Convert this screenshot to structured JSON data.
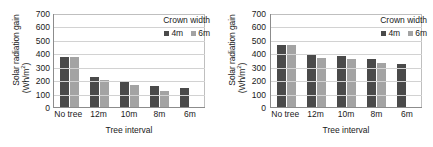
{
  "figure": {
    "panels": [
      "left",
      "right"
    ]
  },
  "chart_data": [
    {
      "type": "bar",
      "panel": "left",
      "title": "",
      "xlabel": "Tree interval",
      "ylabel": "Solar radiation gain (Wh/m2)",
      "ylabel_line1": "Solar radiation gain",
      "ylabel_line2": "(Wh/m²)",
      "categories": [
        "No tree",
        "12m",
        "10m",
        "8m",
        "6m"
      ],
      "yticks": [
        0,
        100,
        200,
        300,
        400,
        500,
        600,
        700
      ],
      "ylim": [
        0,
        700
      ],
      "grid": true,
      "legend_position": "top-right",
      "legend_title": "Crown width",
      "series": [
        {
          "name": "4m",
          "color": "#4a4a4a",
          "values": [
            375,
            225,
            193,
            155,
            138
          ]
        },
        {
          "name": "6m",
          "color": "#a3a3a3",
          "values": [
            375,
            200,
            162,
            120,
            null
          ]
        }
      ]
    },
    {
      "type": "bar",
      "panel": "right",
      "title": "",
      "xlabel": "Tree interval",
      "ylabel": "Solar radiation gain (Wh/m2)",
      "ylabel_line1": "Solar radiation gain",
      "ylabel_line2": "(Wh/m²)",
      "categories": [
        "No tree",
        "12m",
        "10m",
        "8m",
        "6m"
      ],
      "yticks": [
        0,
        100,
        200,
        300,
        400,
        500,
        600,
        700
      ],
      "ylim": [
        0,
        700
      ],
      "grid": true,
      "legend_position": "top-right",
      "legend_title": "Crown width",
      "series": [
        {
          "name": "4m",
          "color": "#4a4a4a",
          "values": [
            460,
            390,
            383,
            357,
            323
          ]
        },
        {
          "name": "6m",
          "color": "#a3a3a3",
          "values": [
            460,
            368,
            358,
            328,
            null
          ]
        }
      ]
    }
  ]
}
